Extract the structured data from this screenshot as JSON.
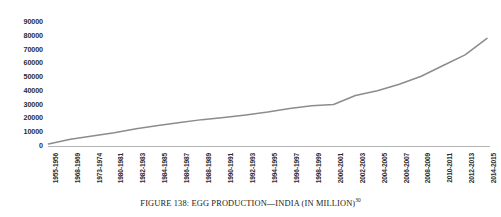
{
  "caption": {
    "text": "FIGURE 138: EGG PRODUCTION—INDIA (IN MILLION)",
    "superscript": "30"
  },
  "chart_data": {
    "type": "line",
    "title": "",
    "xlabel": "",
    "ylabel": "",
    "ylim": [
      0,
      90000
    ],
    "ytick_values": [
      0,
      10000,
      20000,
      30000,
      40000,
      50000,
      60000,
      70000,
      80000,
      90000
    ],
    "ytick_labels": [
      "0",
      "10000",
      "20000",
      "30000",
      "40000",
      "50000",
      "60000",
      "70000",
      "80000",
      "90000"
    ],
    "grid": false,
    "legend": false,
    "line_color": "#8c8c8c",
    "axis_color": "#b5b5b5",
    "categories": [
      "1955-1956",
      "1968-1969",
      "1973-1974",
      "1980-1981",
      "1982-1983",
      "1984-1985",
      "1986-1987",
      "1988-1989",
      "1990-1991",
      "1992-1993",
      "1994-1995",
      "1996-1997",
      "1998-1999",
      "2000-2001",
      "2002-2003",
      "2004-2005",
      "2006-2007",
      "2008-2009",
      "2010-2011",
      "2012-2013",
      "2014-2015"
    ],
    "values": [
      1800,
      5300,
      7700,
      10060,
      12900,
      15300,
      17500,
      19500,
      21100,
      22900,
      25000,
      27500,
      29500,
      30500,
      37000,
      40400,
      45200,
      51000,
      58800,
      66500,
      78500
    ]
  }
}
